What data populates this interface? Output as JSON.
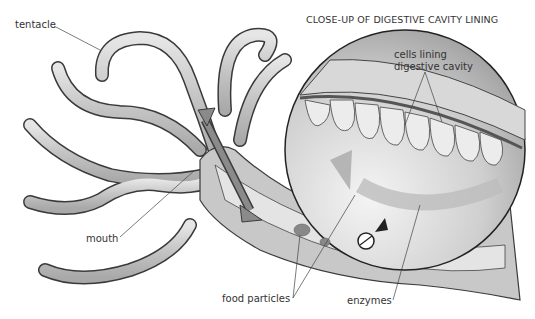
{
  "diagram": {
    "inset_title": "CLOSE-UP OF DIGESTIVE CAVITY LINING",
    "labels": {
      "tentacle": "tentacle",
      "mouth": "mouth",
      "food_particles": "food particles",
      "enzymes": "enzymes",
      "cells_lining_1": "cells lining",
      "cells_lining_2": "digestive cavity"
    },
    "colors": {
      "tentacle_fill": "#c9c9c9",
      "outline": "#3a3a3a",
      "arrow": "#7a7a7a",
      "cavity": "#e2e2e2",
      "inset_bg": "#d4d4d4"
    }
  }
}
